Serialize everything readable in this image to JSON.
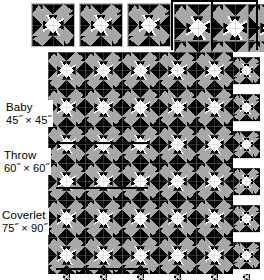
{
  "diagram": {
    "background_color": "#ffffff",
    "rule_color": "#000000",
    "patch_colors": {
      "dark": "#000000",
      "light": "#ffffff",
      "medium": "#a8a8a8",
      "seam": "#9e9e9e",
      "block_border": "#b9b9b9"
    }
  },
  "sizes": [
    {
      "id": "baby",
      "name": "Baby",
      "size": "45˝ × 45˝",
      "width_in": 45,
      "height_in": 45,
      "blocks_across": 3,
      "blocks_down": 3
    },
    {
      "id": "throw",
      "name": "Throw",
      "size": "60˝ × 60˝",
      "width_in": 60,
      "height_in": 60,
      "blocks_across": 4,
      "blocks_down": 4
    },
    {
      "id": "coverlet",
      "name": "Coverlet",
      "size": "75˝ × 90˝",
      "width_in": 75,
      "height_in": 90,
      "blocks_across": 5,
      "blocks_down": 6
    }
  ],
  "sample_blocks": {
    "count": 3,
    "caption": "",
    "labels": [
      "block-sample-1",
      "block-sample-2",
      "block-sample-3"
    ]
  },
  "quilt_grid": {
    "columns": 5,
    "rows": 6,
    "cell_size_px": 37,
    "block_name": "pieced-star-block"
  },
  "rules": {
    "baby_horizontal": "baby-width-rule",
    "throw_horizontal": "throw-width-rule",
    "coverlet_horizontal": "coverlet-width-rule",
    "baby_vertical": "baby-height-rule",
    "throw_vertical": "throw-height-rule",
    "coverlet_vertical": "coverlet-height-rule"
  }
}
